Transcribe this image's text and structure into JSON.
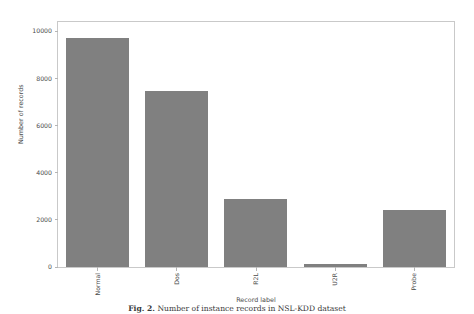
{
  "chart_data": {
    "type": "bar",
    "title": "",
    "xlabel": "Record label",
    "ylabel": "Number of records",
    "categories": [
      "Normal",
      "Dos",
      "R2L",
      "U2R",
      "Probe"
    ],
    "values": [
      9710,
      7460,
      2885,
      110,
      2420
    ],
    "series": [
      {
        "name": "Number of records",
        "values": [
          9710,
          7460,
          2885,
          110,
          2420
        ]
      }
    ],
    "ylim": [
      0,
      10400
    ],
    "xlim": [
      -0.5,
      4.5
    ],
    "yticks": [
      0,
      2000,
      4000,
      6000,
      8000,
      10000
    ],
    "ytick_labels": [
      "0",
      "2000",
      "4000",
      "6000",
      "8000",
      "10000"
    ],
    "xtick_labels": [
      "Normal",
      "Dos",
      "R2L",
      "U2R",
      "Probe"
    ],
    "xtick_rotation": 90,
    "grid": false,
    "legend": false,
    "bar_color": "#808080",
    "axes_color": "#c9c9c9",
    "background": "#ffffff"
  },
  "caption": {
    "lead": "Fig. 2.",
    "text": "Number of instance records in NSL-KDD dataset"
  }
}
